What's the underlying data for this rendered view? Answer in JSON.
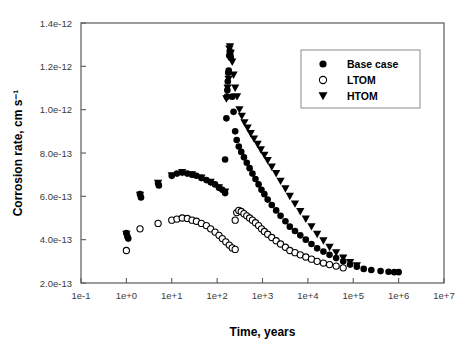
{
  "chart_data": {
    "type": "scatter",
    "title": "",
    "xlabel": "Time, years",
    "ylabel": "Corrosion rate, cm s⁻¹",
    "xscale": "log",
    "yscale": "linear",
    "xlim": [
      0.1,
      10000000
    ],
    "ylim": [
      2e-13,
      1.4e-12
    ],
    "grid": false,
    "legend_position": "top-right",
    "xticks": [
      "1e-1",
      "1e+0",
      "1e+1",
      "1e+2",
      "1e+3",
      "1e+4",
      "1e+5",
      "1e+6",
      "1e+7"
    ],
    "xtick_values": [
      0.1,
      1,
      10,
      100,
      1000,
      10000,
      100000,
      1000000,
      10000000
    ],
    "yticks": [
      "2.0e-13",
      "4.0e-13",
      "6.0e-13",
      "8.0e-13",
      "1.0e-12",
      "1.2e-12",
      "1.4e-12"
    ],
    "ytick_values": [
      2e-13,
      4e-13,
      6e-13,
      8e-13,
      1e-12,
      1.2e-12,
      1.4e-12
    ],
    "series": [
      {
        "name": "Base case",
        "marker": "filled-circle",
        "color": "#000000",
        "points": [
          [
            1.0,
            4.3e-13
          ],
          [
            1.05,
            4.15e-13
          ],
          [
            1.1,
            4.05e-13
          ],
          [
            2.0,
            6.1e-13
          ],
          [
            2.1,
            5.95e-13
          ],
          [
            5.0,
            6.6e-13
          ],
          [
            5.2,
            6.5e-13
          ],
          [
            10.0,
            6.95e-13
          ],
          [
            13.0,
            7.05e-13
          ],
          [
            17.0,
            7.1e-13
          ],
          [
            22.0,
            7.05e-13
          ],
          [
            28.0,
            7e-13
          ],
          [
            35.0,
            6.95e-13
          ],
          [
            45.0,
            6.85e-13
          ],
          [
            58.0,
            6.75e-13
          ],
          [
            72.0,
            6.65e-13
          ],
          [
            90.0,
            6.55e-13
          ],
          [
            110.0,
            6.4e-13
          ],
          [
            130.0,
            6.3e-13
          ],
          [
            150.0,
            6.15e-13
          ],
          [
            150.0,
            7.7e-13
          ],
          [
            160.0,
            9.6e-13
          ],
          [
            165.0,
            1.06e-12
          ],
          [
            168.0,
            1.09e-12
          ],
          [
            172.0,
            1.13e-12
          ],
          [
            176.0,
            1.17e-12
          ],
          [
            180.0,
            1.18e-12
          ],
          [
            185.0,
            1.25e-12
          ],
          [
            190.0,
            1.27e-12
          ],
          [
            195.0,
            1.255e-12
          ],
          [
            200.0,
            1.24e-12
          ],
          [
            215.0,
            1.06e-12
          ],
          [
            230.0,
            9.9e-13
          ],
          [
            250.0,
            9e-13
          ],
          [
            270.0,
            8.6e-13
          ],
          [
            300.0,
            8.3e-13
          ],
          [
            340.0,
            8.05e-13
          ],
          [
            390.0,
            7.8e-13
          ],
          [
            450.0,
            7.55e-13
          ],
          [
            520.0,
            7.3e-13
          ],
          [
            600.0,
            7.05e-13
          ],
          [
            700.0,
            6.8e-13
          ],
          [
            820.0,
            6.55e-13
          ],
          [
            950.0,
            6.3e-13
          ],
          [
            1100.0,
            6.1e-13
          ],
          [
            1300.0,
            5.85e-13
          ],
          [
            1600.0,
            5.6e-13
          ],
          [
            2000.0,
            5.35e-13
          ],
          [
            2500.0,
            5.1e-13
          ],
          [
            3200.0,
            4.85e-13
          ],
          [
            4000.0,
            4.6e-13
          ],
          [
            5200.0,
            4.4e-13
          ],
          [
            6800.0,
            4.2e-13
          ],
          [
            9000.0,
            4e-13
          ],
          [
            12000.0,
            3.8e-13
          ],
          [
            16000.0,
            3.6e-13
          ],
          [
            22000.0,
            3.45e-13
          ],
          [
            30000.0,
            3.3e-13
          ],
          [
            42000.0,
            3.15e-13
          ],
          [
            60000.0,
            3e-13
          ],
          [
            85000.0,
            2.85e-13
          ],
          [
            120000.0,
            2.75e-13
          ],
          [
            170000.0,
            2.65e-13
          ],
          [
            250000.0,
            2.6e-13
          ],
          [
            400000.0,
            2.55e-13
          ],
          [
            600000.0,
            2.52e-13
          ],
          [
            800000.0,
            2.5e-13
          ],
          [
            1000000.0,
            2.5e-13
          ]
        ]
      },
      {
        "name": "LTOM",
        "marker": "open-circle",
        "color": "#000000",
        "points": [
          [
            1.0,
            3.5e-13
          ],
          [
            2.0,
            4.5e-13
          ],
          [
            5.0,
            4.75e-13
          ],
          [
            10.0,
            4.9e-13
          ],
          [
            13.0,
            4.95e-13
          ],
          [
            17.0,
            5e-13
          ],
          [
            22.0,
            4.98e-13
          ],
          [
            28.0,
            4.9e-13
          ],
          [
            35.0,
            4.85e-13
          ],
          [
            45.0,
            4.75e-13
          ],
          [
            58.0,
            4.65e-13
          ],
          [
            72.0,
            4.5e-13
          ],
          [
            90.0,
            4.35e-13
          ],
          [
            110.0,
            4.2e-13
          ],
          [
            130.0,
            4.05e-13
          ],
          [
            155.0,
            3.9e-13
          ],
          [
            185.0,
            3.75e-13
          ],
          [
            215.0,
            3.62e-13
          ],
          [
            250.0,
            3.55e-13
          ],
          [
            250.0,
            4.9e-13
          ],
          [
            270.0,
            5.25e-13
          ],
          [
            300.0,
            5.35e-13
          ],
          [
            340.0,
            5.3e-13
          ],
          [
            390.0,
            5.2e-13
          ],
          [
            450.0,
            5.1e-13
          ],
          [
            520.0,
            5e-13
          ],
          [
            600.0,
            4.9e-13
          ],
          [
            700.0,
            4.78e-13
          ],
          [
            820.0,
            4.65e-13
          ],
          [
            950.0,
            4.5e-13
          ],
          [
            1100.0,
            4.38e-13
          ],
          [
            1300.0,
            4.25e-13
          ],
          [
            1600.0,
            4.1e-13
          ],
          [
            2000.0,
            3.95e-13
          ],
          [
            2500.0,
            3.8e-13
          ],
          [
            3200.0,
            3.65e-13
          ],
          [
            4000.0,
            3.5e-13
          ],
          [
            5200.0,
            3.4e-13
          ],
          [
            6800.0,
            3.3e-13
          ],
          [
            9000.0,
            3.2e-13
          ],
          [
            12000.0,
            3.1e-13
          ],
          [
            16000.0,
            3e-13
          ],
          [
            22000.0,
            2.92e-13
          ],
          [
            30000.0,
            2.85e-13
          ],
          [
            42000.0,
            2.78e-13
          ],
          [
            60000.0,
            2.7e-13
          ]
        ]
      },
      {
        "name": "HTOM",
        "marker": "filled-triangle-down",
        "color": "#000000",
        "points": [
          [
            1.0,
            4.25e-13
          ],
          [
            2.0,
            6.05e-13
          ],
          [
            5.0,
            6.6e-13
          ],
          [
            10.0,
            6.95e-13
          ],
          [
            17.0,
            7.1e-13
          ],
          [
            28.0,
            7e-13
          ],
          [
            45.0,
            6.85e-13
          ],
          [
            72.0,
            6.65e-13
          ],
          [
            110.0,
            6.4e-13
          ],
          [
            150.0,
            6.2e-13
          ],
          [
            160.0,
            1.05e-12
          ],
          [
            170.0,
            1.1e-12
          ],
          [
            178.0,
            1.14e-12
          ],
          [
            186.0,
            1.28e-12
          ],
          [
            192.0,
            1.29e-12
          ],
          [
            200.0,
            1.26e-12
          ],
          [
            215.0,
            1.22e-12
          ],
          [
            230.0,
            1.16e-12
          ],
          [
            250.0,
            1.1e-12
          ],
          [
            275.0,
            1.06e-12
          ],
          [
            310.0,
            1e-12
          ],
          [
            350.0,
            9.7e-13
          ],
          [
            400.0,
            9.4e-13
          ],
          [
            470.0,
            9.15e-13
          ],
          [
            550.0,
            8.9e-13
          ],
          [
            650.0,
            8.65e-13
          ],
          [
            780.0,
            8.4e-13
          ],
          [
            920.0,
            8.15e-13
          ],
          [
            1100.0,
            7.9e-13
          ],
          [
            1300.0,
            7.65e-13
          ],
          [
            1600.0,
            7.35e-13
          ],
          [
            2000.0,
            7.05e-13
          ],
          [
            2500.0,
            6.7e-13
          ],
          [
            3200.0,
            6.35e-13
          ],
          [
            4000.0,
            6e-13
          ],
          [
            5200.0,
            5.65e-13
          ],
          [
            6800.0,
            5.3e-13
          ],
          [
            9000.0,
            4.95e-13
          ],
          [
            12000.0,
            4.6e-13
          ],
          [
            16000.0,
            4.25e-13
          ],
          [
            22000.0,
            3.95e-13
          ],
          [
            30000.0,
            3.65e-13
          ],
          [
            42000.0,
            3.4e-13
          ],
          [
            60000.0,
            3.15e-13
          ],
          [
            85000.0,
            2.95e-13
          ],
          [
            120000.0,
            2.8e-13
          ]
        ]
      }
    ]
  },
  "legend": {
    "entries": [
      {
        "label": "Base case",
        "marker": "filled-circle"
      },
      {
        "label": "LTOM",
        "marker": "open-circle"
      },
      {
        "label": "HTOM",
        "marker": "filled-triangle-down"
      }
    ]
  },
  "axes": {
    "x_title": "Time, years",
    "y_title": "Corrosion rate, cm s⁻¹"
  }
}
